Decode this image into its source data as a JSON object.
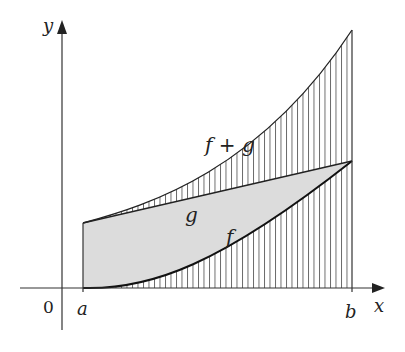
{
  "diagram": {
    "axes": {
      "x_label": "x",
      "y_label": "y",
      "origin_label": "0",
      "tick_labels": [
        "a",
        "b"
      ]
    },
    "curves": [
      {
        "name": "f",
        "label": "f",
        "description": "increasing convex curve starting at zero at x=a"
      },
      {
        "name": "g",
        "label": "g",
        "description": "nearly linear increasing curve, positive at x=a"
      },
      {
        "name": "f+g",
        "label": "f + g",
        "description": "sum of f and g"
      }
    ],
    "regions": [
      {
        "name": "area-under-g",
        "fill": "light-gray",
        "color": "#dcdcdc"
      },
      {
        "name": "area-under-f",
        "fill": "vertical-hatch"
      },
      {
        "name": "area-between-g-and-f+g",
        "fill": "vertical-hatch"
      }
    ],
    "colors": {
      "axis": "#333333",
      "curve": "#222222",
      "gray_fill": "#dcdcdc",
      "hatch": "#555555"
    }
  }
}
